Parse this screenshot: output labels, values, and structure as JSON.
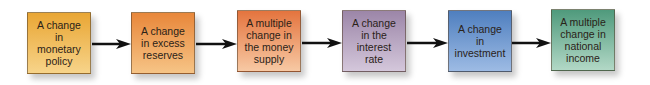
{
  "diagram": {
    "type": "flowchart",
    "direction": "left-to-right",
    "nodes": [
      {
        "id": "n1",
        "label": "A change\nin\nmonetary\npolicy",
        "color_top": "#e9a634",
        "color_bottom": "#f7d48a"
      },
      {
        "id": "n2",
        "label": "A change\nin excess\nreserves",
        "color_top": "#e8873a",
        "color_bottom": "#f6c486"
      },
      {
        "id": "n3",
        "label": "A multiple\nchange in\nthe money\nsupply",
        "color_top": "#e4743e",
        "color_bottom": "#f7c9a4"
      },
      {
        "id": "n4",
        "label": "A change\nin the\ninterest\nrate",
        "color_top": "#9c86a8",
        "color_bottom": "#d4c7db"
      },
      {
        "id": "n5",
        "label": "A change\nin\ninvestment",
        "color_top": "#4f7fbf",
        "color_bottom": "#9dbbe4"
      },
      {
        "id": "n6",
        "label": "A multiple\nchange in\nnational\nincome",
        "color_top": "#4f9a7c",
        "color_bottom": "#b2d8c6"
      }
    ],
    "edges": [
      {
        "from": "n1",
        "to": "n2"
      },
      {
        "from": "n2",
        "to": "n3"
      },
      {
        "from": "n3",
        "to": "n4"
      },
      {
        "from": "n4",
        "to": "n5"
      },
      {
        "from": "n5",
        "to": "n6"
      }
    ],
    "arrow_color": "#111111"
  }
}
